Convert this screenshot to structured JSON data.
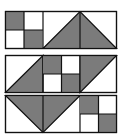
{
  "diagram": {
    "title": "",
    "colors": {
      "fill": "#7b7b7b",
      "stroke": "#111111",
      "background": "#ffffff"
    },
    "panels": [
      {
        "id": "panel-1",
        "cells": [
          {
            "type": "checker-2x2",
            "pattern": [
              "gray",
              "white",
              "white",
              "gray"
            ]
          },
          {
            "type": "triangle-up-spanning-two-cells",
            "apex": "top-center"
          }
        ]
      },
      {
        "id": "panel-2",
        "cells": [
          {
            "type": "diagonal",
            "shaded": "lower-right"
          },
          {
            "type": "checker-2x2",
            "pattern": [
              "gray",
              "white",
              "white",
              "gray"
            ]
          },
          {
            "type": "diagonal",
            "shaded": "upper-left"
          }
        ]
      },
      {
        "id": "panel-3",
        "cells": [
          {
            "type": "triangle-down-spanning-two-cells",
            "apex": "bottom-center"
          },
          {
            "type": "checker-2x2",
            "pattern": [
              "gray",
              "white",
              "white",
              "gray"
            ]
          }
        ]
      }
    ]
  }
}
